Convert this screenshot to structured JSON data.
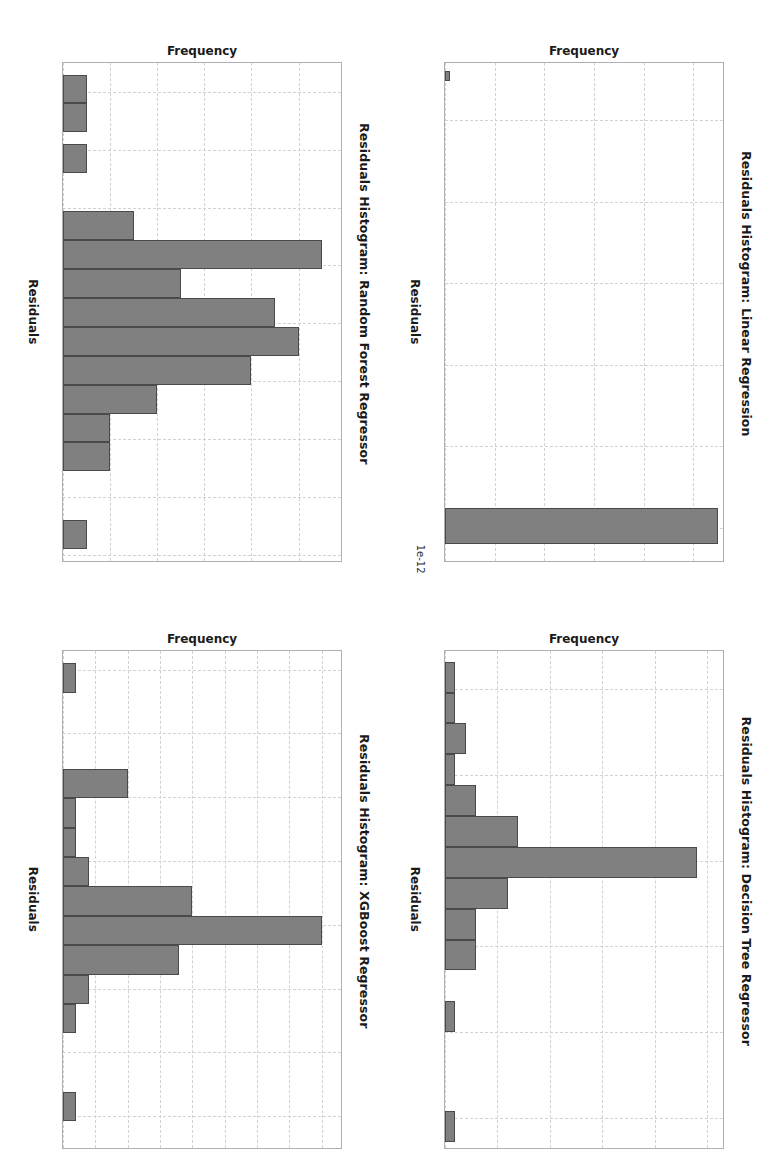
{
  "figure": {
    "background": "#ffffff",
    "bar_color": "#808080",
    "bar_edge_color": "#4a4a4a",
    "grid_color": "#d2d2d2",
    "orientation": "rotated-90-clockwise"
  },
  "chart_data": [
    {
      "id": "linear-regression",
      "type": "bar",
      "title": "Residuals Histogram: Linear Regression",
      "xlabel": "Residuals",
      "ylabel": "Frequency",
      "x_exponent_label": "1e-12",
      "grid": true,
      "xlim": [
        -2.85,
        0.2
      ],
      "ylim": [
        0,
        56
      ],
      "xticks": [
        "-2.5",
        "-2.0",
        "-1.5",
        "-1.0",
        "-0.5",
        "0.0"
      ],
      "xtick_values": [
        -2.5,
        -2.0,
        -1.5,
        -1.0,
        -0.5,
        0.0
      ],
      "yticks": [
        "0",
        "10",
        "20",
        "30",
        "40",
        "50"
      ],
      "ytick_values": [
        0,
        10,
        20,
        30,
        40,
        50
      ],
      "bins": [
        {
          "left": -2.8,
          "right": -2.74,
          "value": 1
        },
        {
          "left": -0.12,
          "right": 0.1,
          "value": 55
        }
      ]
    },
    {
      "id": "decision-tree-regressor",
      "type": "bar",
      "title": "Residuals Histogram: Decision Tree Regressor",
      "xlabel": "Residuals",
      "ylabel": "Frequency",
      "grid": true,
      "xlim": [
        -0.245,
        0.335
      ],
      "ylim": [
        0,
        26.5
      ],
      "xticks": [
        "-0.2",
        "-0.1",
        "0.0",
        "0.1",
        "0.2",
        "0.3"
      ],
      "xtick_values": [
        -0.2,
        -0.1,
        0.0,
        0.1,
        0.2,
        0.3
      ],
      "yticks": [
        "0",
        "5",
        "10",
        "15",
        "20",
        "25"
      ],
      "ytick_values": [
        0,
        5,
        10,
        15,
        20,
        25
      ],
      "bins": [
        {
          "left": -0.232,
          "right": -0.196,
          "value": 1
        },
        {
          "left": -0.196,
          "right": -0.16,
          "value": 1
        },
        {
          "left": -0.16,
          "right": -0.124,
          "value": 2
        },
        {
          "left": -0.124,
          "right": -0.088,
          "value": 1
        },
        {
          "left": -0.088,
          "right": -0.052,
          "value": 3
        },
        {
          "left": -0.052,
          "right": -0.016,
          "value": 7
        },
        {
          "left": -0.016,
          "right": 0.02,
          "value": 24
        },
        {
          "left": 0.02,
          "right": 0.056,
          "value": 6
        },
        {
          "left": 0.056,
          "right": 0.092,
          "value": 3
        },
        {
          "left": 0.092,
          "right": 0.128,
          "value": 3
        },
        {
          "left": 0.164,
          "right": 0.2,
          "value": 1
        },
        {
          "left": 0.292,
          "right": 0.328,
          "value": 1
        }
      ]
    },
    {
      "id": "random-forest-regressor",
      "type": "bar",
      "title": "Residuals Histogram: Random Forest Regressor",
      "xlabel": "Residuals",
      "ylabel": "Frequency",
      "grid": true,
      "xlim": [
        -0.225,
        0.205
      ],
      "ylim": [
        0,
        11.8
      ],
      "xticks": [
        "-0.20",
        "-0.15",
        "-0.10",
        "-0.05",
        "0.00",
        "0.05",
        "0.10",
        "0.15",
        "0.20"
      ],
      "xtick_values": [
        -0.2,
        -0.15,
        -0.1,
        -0.05,
        0.0,
        0.05,
        0.1,
        0.15,
        0.2
      ],
      "yticks": [
        "0",
        "2",
        "4",
        "6",
        "8",
        "10"
      ],
      "ytick_values": [
        0,
        2,
        4,
        6,
        8,
        10
      ],
      "bins": [
        {
          "left": -0.215,
          "right": -0.19,
          "value": 1
        },
        {
          "left": -0.19,
          "right": -0.165,
          "value": 1
        },
        {
          "left": -0.155,
          "right": -0.13,
          "value": 1
        },
        {
          "left": -0.097,
          "right": -0.072,
          "value": 3
        },
        {
          "left": -0.072,
          "right": -0.047,
          "value": 11
        },
        {
          "left": -0.047,
          "right": -0.022,
          "value": 5
        },
        {
          "left": -0.022,
          "right": 0.003,
          "value": 9
        },
        {
          "left": 0.003,
          "right": 0.028,
          "value": 10
        },
        {
          "left": 0.028,
          "right": 0.053,
          "value": 8
        },
        {
          "left": 0.053,
          "right": 0.078,
          "value": 4
        },
        {
          "left": 0.078,
          "right": 0.103,
          "value": 2
        },
        {
          "left": 0.103,
          "right": 0.128,
          "value": 2
        },
        {
          "left": 0.17,
          "right": 0.195,
          "value": 1
        }
      ]
    },
    {
      "id": "xgboost-regressor",
      "type": "bar",
      "title": "Residuals Histogram: XGBoost Regressor",
      "xlabel": "Residuals",
      "ylabel": "Frequency",
      "grid": true,
      "xlim": [
        -0.215,
        0.175
      ],
      "ylim": [
        0,
        21.5
      ],
      "xticks": [
        "-0.20",
        "-0.15",
        "-0.10",
        "-0.05",
        "0.00",
        "0.05",
        "0.10",
        "0.15"
      ],
      "xtick_values": [
        -0.2,
        -0.15,
        -0.1,
        -0.05,
        0.0,
        0.05,
        0.1,
        0.15
      ],
      "yticks": [
        "0.0",
        "2.5",
        "5.0",
        "7.5",
        "10.0",
        "12.5",
        "15.0",
        "17.5",
        "20.0"
      ],
      "ytick_values": [
        0,
        2.5,
        5,
        7.5,
        10,
        12.5,
        15,
        17.5,
        20
      ],
      "bins": [
        {
          "left": -0.205,
          "right": -0.182,
          "value": 1
        },
        {
          "left": -0.122,
          "right": -0.099,
          "value": 5
        },
        {
          "left": -0.099,
          "right": -0.076,
          "value": 1
        },
        {
          "left": -0.076,
          "right": -0.053,
          "value": 1
        },
        {
          "left": -0.053,
          "right": -0.03,
          "value": 2
        },
        {
          "left": -0.03,
          "right": -0.007,
          "value": 10
        },
        {
          "left": -0.007,
          "right": 0.016,
          "value": 20
        },
        {
          "left": 0.016,
          "right": 0.039,
          "value": 9
        },
        {
          "left": 0.039,
          "right": 0.062,
          "value": 2
        },
        {
          "left": 0.062,
          "right": 0.085,
          "value": 1
        },
        {
          "left": 0.131,
          "right": 0.154,
          "value": 1
        }
      ]
    }
  ]
}
